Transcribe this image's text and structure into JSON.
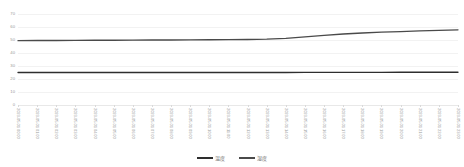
{
  "chart_data": {
    "type": "line",
    "title": "",
    "subtitle": "",
    "xlabel": "",
    "ylabel": "",
    "ylim": [
      0,
      70
    ],
    "yticks": [
      0,
      10,
      20,
      30,
      40,
      50,
      60,
      70
    ],
    "ytick_labels": [
      "0",
      "10",
      "20",
      "30",
      "40",
      "50",
      "60",
      "70"
    ],
    "grid": true,
    "legend_position": "bottom-center",
    "legend": [
      "温度",
      "湿度"
    ],
    "x": [
      "2023-05-01 00:00",
      "2023-05-01 01:00",
      "2023-05-01 02:00",
      "2023-05-01 03:00",
      "2023-05-01 04:00",
      "2023-05-01 05:00",
      "2023-05-01 06:00",
      "2023-05-01 07:00",
      "2023-05-01 08:00",
      "2023-05-01 09:00",
      "2023-05-01 10:00",
      "2023-05-01 11:00",
      "2023-05-01 12:00",
      "2023-05-01 13:00",
      "2023-05-01 14:00",
      "2023-05-01 15:00",
      "2023-05-01 16:00",
      "2023-05-01 17:00",
      "2023-05-01 18:00",
      "2023-05-01 19:00",
      "2023-05-01 20:00",
      "2023-05-01 21:00",
      "2023-05-01 22:00",
      "2023-05-01 23:00"
    ],
    "categories": [
      "2023-05-01 00:00",
      "2023-05-01 01:00",
      "2023-05-01 02:00",
      "2023-05-01 03:00",
      "2023-05-01 04:00",
      "2023-05-01 05:00",
      "2023-05-01 06:00",
      "2023-05-01 07:00",
      "2023-05-01 08:00",
      "2023-05-01 09:00",
      "2023-05-01 10:00",
      "2023-05-01 11:00",
      "2023-05-01 12:00",
      "2023-05-01 13:00",
      "2023-05-01 14:00",
      "2023-05-01 15:00",
      "2023-05-01 16:00",
      "2023-05-01 17:00",
      "2023-05-01 18:00",
      "2023-05-01 19:00",
      "2023-05-01 20:00",
      "2023-05-01 21:00",
      "2023-05-01 22:00",
      "2023-05-01 23:00"
    ],
    "series": [
      {
        "name": "湿度",
        "color": "#4a4a4a",
        "values": [
          49.5,
          49.6,
          49.6,
          49.7,
          49.8,
          49.8,
          49.9,
          50.0,
          50.0,
          50.1,
          50.2,
          50.3,
          50.4,
          50.6,
          51.2,
          52.4,
          53.6,
          54.6,
          55.4,
          56.0,
          56.5,
          57.0,
          57.4,
          57.8
        ]
      },
      {
        "name": "温度",
        "color": "#2e2e2e",
        "values": [
          25.0,
          25.0,
          25.0,
          25.0,
          25.0,
          25.0,
          25.0,
          25.0,
          25.0,
          25.0,
          25.0,
          25.0,
          25.0,
          25.0,
          25.0,
          25.1,
          25.1,
          25.1,
          25.1,
          25.1,
          25.2,
          25.2,
          25.2,
          25.2
        ]
      }
    ]
  }
}
